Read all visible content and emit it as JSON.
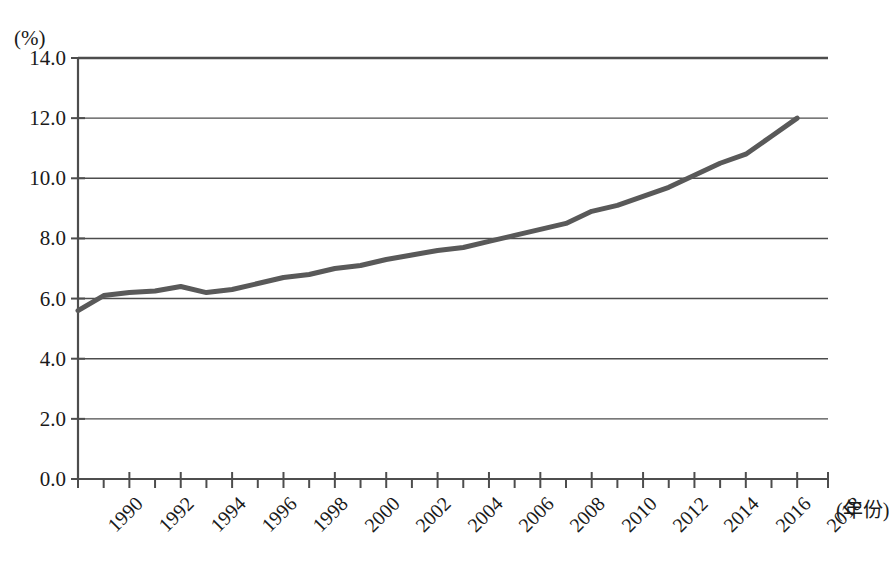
{
  "chart_data": {
    "type": "line",
    "title": "",
    "subtitle": "",
    "xlabel": "(年份)",
    "ylabel": "(%)",
    "xlim": [
      1990,
      2019.2
    ],
    "ylim": [
      0.0,
      14.0
    ],
    "grid": "horizontal",
    "legend": "none",
    "y_ticks": [
      "0.0",
      "2.0",
      "4.0",
      "6.0",
      "8.0",
      "10.0",
      "12.0",
      "14.0"
    ],
    "y_tick_values": [
      0.0,
      2.0,
      4.0,
      6.0,
      8.0,
      10.0,
      12.0,
      14.0
    ],
    "x_ticks": [
      "1990",
      "1992",
      "1994",
      "1996",
      "1998",
      "2000",
      "2002",
      "2004",
      "2006",
      "2008",
      "2010",
      "2012",
      "2014",
      "2016",
      "2018"
    ],
    "x_minor_step": 1,
    "series": [
      {
        "name": "",
        "color": "#595959",
        "line_width": 5,
        "x": [
          1990,
          1991,
          1992,
          1993,
          1994,
          1995,
          1996,
          1997,
          1998,
          1999,
          2000,
          2001,
          2002,
          2003,
          2004,
          2005,
          2006,
          2007,
          2008,
          2009,
          2010,
          2011,
          2012,
          2013,
          2014,
          2015,
          2016,
          2017,
          2018
        ],
        "values": [
          5.6,
          6.1,
          6.2,
          6.25,
          6.4,
          6.2,
          6.3,
          6.5,
          6.7,
          6.8,
          7.0,
          7.1,
          7.3,
          7.45,
          7.6,
          7.7,
          7.9,
          8.1,
          8.3,
          8.5,
          8.9,
          9.1,
          9.4,
          9.7,
          10.1,
          10.5,
          10.8,
          11.4,
          12.0
        ]
      }
    ]
  },
  "axis": {
    "unit_label": "(%)",
    "x_title": "(年份)"
  }
}
